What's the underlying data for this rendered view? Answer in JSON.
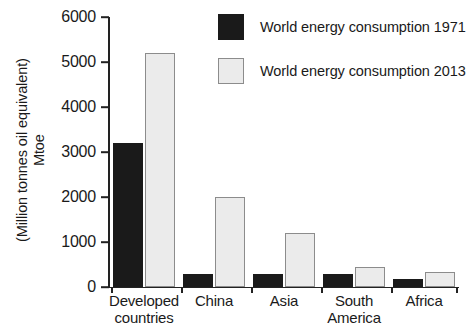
{
  "chart_data": {
    "type": "bar",
    "title": "",
    "xlabel": "",
    "ylabel_lines": [
      "Mtoe",
      "(Million tonnes oil equivalent)"
    ],
    "categories": [
      "Developed countries",
      "China",
      "Asia",
      "South America",
      "Africa"
    ],
    "category_lines": [
      [
        "Developed",
        "countries"
      ],
      [
        "China"
      ],
      [
        "Asia"
      ],
      [
        "South",
        "America"
      ],
      [
        "Africa"
      ]
    ],
    "series": [
      {
        "name": "World energy consumption 1971",
        "color": "#1a1a1a",
        "values": [
          3200,
          280,
          280,
          280,
          180
        ]
      },
      {
        "name": "World energy consumption 2013",
        "color": "#ebebeb",
        "values": [
          5200,
          2000,
          1200,
          450,
          340
        ]
      }
    ],
    "ylim": [
      0,
      6000
    ],
    "yticks": [
      0,
      1000,
      2000,
      3000,
      4000,
      5000,
      6000
    ],
    "ytick_labels": [
      "0",
      "1000",
      "2000",
      "3000",
      "4000",
      "5000",
      "6000"
    ],
    "grid": false,
    "legend_position": "top-right"
  },
  "legend": {
    "entries": [
      "World energy consumption 1971",
      "World energy consumption 2013"
    ]
  }
}
